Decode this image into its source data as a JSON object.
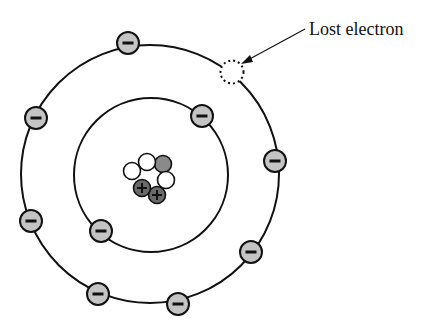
{
  "diagram": {
    "annotation": {
      "label": "Lost electron"
    },
    "colors": {
      "electron_fill": "#c4c4c4",
      "proton_fill": "#6a6a6a",
      "neutron_fill": "#ffffff",
      "gray_nucleon_fill": "#8a8a8a",
      "stroke": "#111111"
    },
    "electron_sign": "−",
    "proton_sign": "+",
    "orbits": [
      {
        "name": "inner",
        "cx": 151,
        "cy": 175,
        "r": 77
      },
      {
        "name": "outer",
        "cx": 150,
        "cy": 174,
        "r": 129
      }
    ],
    "electrons": [
      {
        "orbit": "inner",
        "x": 202,
        "y": 116
      },
      {
        "orbit": "inner",
        "x": 101,
        "y": 231
      },
      {
        "orbit": "outer",
        "x": 128,
        "y": 43
      },
      {
        "orbit": "outer",
        "x": 36,
        "y": 118
      },
      {
        "orbit": "outer",
        "x": 31,
        "y": 221
      },
      {
        "orbit": "outer",
        "x": 98,
        "y": 294
      },
      {
        "orbit": "outer",
        "x": 178,
        "y": 304
      },
      {
        "orbit": "outer",
        "x": 251,
        "y": 252
      },
      {
        "orbit": "outer",
        "x": 275,
        "y": 161
      }
    ],
    "lost_electron": {
      "x": 232,
      "y": 72
    },
    "nucleus": [
      {
        "type": "neutron",
        "x": 132,
        "y": 171
      },
      {
        "type": "gray",
        "x": 163,
        "y": 164
      },
      {
        "type": "neutron",
        "x": 147,
        "y": 162
      },
      {
        "type": "neutron",
        "x": 166,
        "y": 180
      },
      {
        "type": "proton",
        "x": 157,
        "y": 195
      },
      {
        "type": "proton",
        "x": 142,
        "y": 188
      }
    ]
  }
}
